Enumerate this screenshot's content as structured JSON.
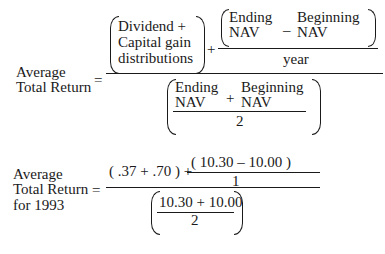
{
  "formula1": {
    "lhs": [
      "Average",
      "Total Return"
    ],
    "equals": "=",
    "numerator": {
      "group1": [
        "Dividend +",
        "Capital gain",
        "distributions"
      ],
      "plus": "+",
      "frac": {
        "ending": [
          "Ending",
          "NAV"
        ],
        "minus": "–",
        "beginning": [
          "Beginning",
          "NAV"
        ],
        "denominator": "year"
      }
    },
    "denominator": {
      "ending": [
        "Ending",
        "NAV"
      ],
      "plus": "+",
      "beginning": [
        "Beginning",
        "NAV"
      ],
      "divisor": "2"
    }
  },
  "formula2": {
    "lhs": [
      "Average",
      "Total Return",
      "for 1993"
    ],
    "equals": "=",
    "numerator": {
      "left": "( .37 + .70 ) +",
      "frac_top": "( 10.30 – 10.00 )",
      "frac_bottom": "1"
    },
    "denominator": {
      "top": "10.30 + 10.00",
      "bottom": "2"
    }
  }
}
